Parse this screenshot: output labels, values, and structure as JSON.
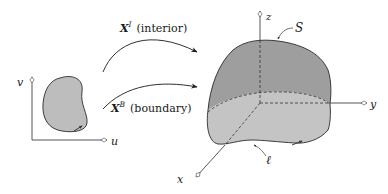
{
  "diagram": {
    "left_domain": {
      "axis_u_label": "u",
      "axis_v_label": "v",
      "region_fill": "#bdbdbd"
    },
    "maps": [
      {
        "symbol": "X",
        "superscript": "I",
        "description": "(interior)"
      },
      {
        "symbol": "X",
        "superscript": "B",
        "description": "(boundary)"
      }
    ],
    "right_volume": {
      "axis_x_label": "x",
      "axis_y_label": "y",
      "axis_z_label": "z",
      "surface_label": "S",
      "curve_label": "ℓ",
      "top_fill": "#9e9e9e",
      "bottom_fill": "#c4c4c4"
    },
    "colors": {
      "stroke": "#2a2a2a",
      "axis": "#444444"
    }
  }
}
